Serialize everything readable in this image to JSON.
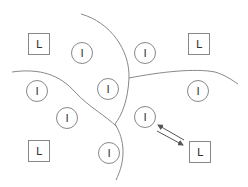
{
  "diagram": {
    "colors": {
      "stroke": "#888888",
      "text": "#333333",
      "arrow": "#555555",
      "background": "#ffffff"
    },
    "landmarks": [
      {
        "label": "L",
        "x": 39,
        "y": 44
      },
      {
        "label": "L",
        "x": 199,
        "y": 44
      },
      {
        "label": "L",
        "x": 39,
        "y": 151
      },
      {
        "label": "L",
        "x": 200,
        "y": 152
      }
    ],
    "instances": [
      {
        "label": "I",
        "x": 82,
        "y": 53
      },
      {
        "label": "I",
        "x": 145,
        "y": 53
      },
      {
        "label": "I",
        "x": 37,
        "y": 91
      },
      {
        "label": "I",
        "x": 108,
        "y": 89
      },
      {
        "label": "I",
        "x": 198,
        "y": 91
      },
      {
        "label": "I",
        "x": 67,
        "y": 118
      },
      {
        "label": "I",
        "x": 145,
        "y": 117
      },
      {
        "label": "I",
        "x": 109,
        "y": 153
      }
    ],
    "boundaries": [
      "M 81 14 C 110 22, 130 50, 129 78 C 128 100, 122 115, 115 124 C 125 140, 126 160, 116 180",
      "M 12 72 C 40 68, 60 75, 75 92 C 90 108, 105 115, 117 127",
      "M 129 78 C 160 72, 195 68, 215 72 C 225 75, 232 80, 238 84"
    ],
    "arrows": [
      {
        "from": [
          184,
          140
        ],
        "to": [
          158,
          125
        ]
      },
      {
        "from": [
          157,
          131
        ],
        "to": [
          183,
          145
        ]
      }
    ]
  }
}
